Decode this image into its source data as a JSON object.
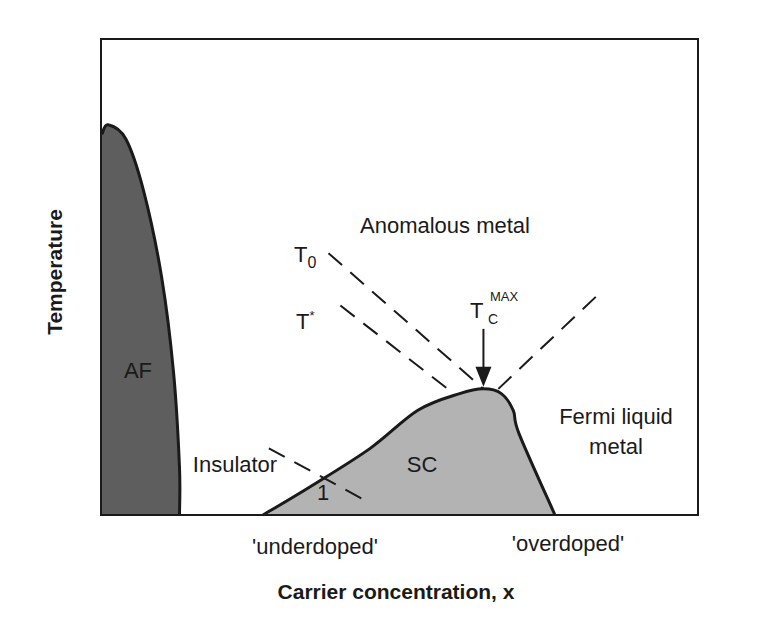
{
  "chart_data": {
    "type": "diagram",
    "title": "",
    "xlabel": "Carrier concentration, x",
    "ylabel": "Temperature",
    "xlim": [
      0,
      1
    ],
    "ylim": [
      0,
      1
    ],
    "x_tick_labels": [
      "'underdoped'",
      "'overdoped'"
    ],
    "regions": [
      {
        "name": "AF",
        "label": "AF",
        "color": "#5e5e5e",
        "boundary": [
          [
            0.0,
            0.8
          ],
          [
            0.01,
            0.82
          ],
          [
            0.04,
            0.79
          ],
          [
            0.07,
            0.68
          ],
          [
            0.1,
            0.5
          ],
          [
            0.12,
            0.3
          ],
          [
            0.13,
            0.1
          ],
          [
            0.13,
            0.0
          ],
          [
            0.0,
            0.0
          ]
        ]
      },
      {
        "name": "SC",
        "label": "SC",
        "color": "#b3b3b3",
        "boundary": [
          [
            0.27,
            0.0
          ],
          [
            0.35,
            0.06
          ],
          [
            0.45,
            0.14
          ],
          [
            0.53,
            0.22
          ],
          [
            0.6,
            0.255
          ],
          [
            0.64,
            0.265
          ],
          [
            0.67,
            0.255
          ],
          [
            0.69,
            0.22
          ],
          [
            0.7,
            0.17
          ],
          [
            0.76,
            0.0
          ]
        ]
      }
    ],
    "dashed_lines": [
      {
        "name": "T0",
        "label": "T",
        "subscript": "0",
        "points": [
          [
            0.38,
            0.55
          ],
          [
            0.64,
            0.265
          ]
        ]
      },
      {
        "name": "T-star",
        "label": "T",
        "superscript": "*",
        "points": [
          [
            0.4,
            0.44
          ],
          [
            0.58,
            0.265
          ]
        ]
      },
      {
        "name": "fermi-boundary",
        "label": "",
        "points": [
          [
            0.665,
            0.265
          ],
          [
            0.83,
            0.46
          ]
        ]
      },
      {
        "name": "line-1",
        "label": "1",
        "points": [
          [
            0.28,
            0.14
          ],
          [
            0.45,
            0.025
          ]
        ]
      }
    ],
    "annotations": [
      {
        "name": "anomalous-metal",
        "text": "Anomalous metal"
      },
      {
        "name": "fermi-liquid",
        "text": "Fermi liquid",
        "text2": "metal"
      },
      {
        "name": "insulator",
        "text": "Insulator"
      },
      {
        "name": "tc-max",
        "text": "T",
        "subscript": "C",
        "superscript": "MAX",
        "arrow_to": [
          0.64,
          0.265
        ]
      }
    ]
  }
}
